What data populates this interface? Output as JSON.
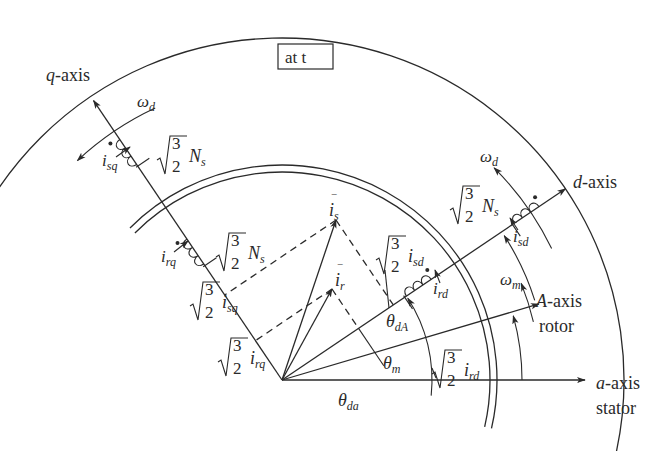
{
  "title_box": "at t",
  "axes": {
    "q_axis": {
      "name": "q",
      "suffix": "-axis"
    },
    "d_axis": {
      "name": "d",
      "suffix": "-axis"
    },
    "A_axis": {
      "name": "A",
      "suffix": "-axis",
      "sub": "rotor"
    },
    "a_axis": {
      "name": "a",
      "suffix": "-axis",
      "sub": "stator"
    }
  },
  "angles_deg": {
    "d_axis": 34,
    "q_axis": 124,
    "A_axis": 16.5,
    "a_axis": 0
  },
  "vectors": {
    "i_s": {
      "label": "i",
      "sub": "s"
    },
    "i_r": {
      "label": "i",
      "sub": "r"
    }
  },
  "labels": {
    "omega_d": {
      "main": "ω",
      "sub": "d"
    },
    "omega_m": {
      "main": "ω",
      "sub": "m"
    },
    "theta_da": {
      "main": "θ",
      "sub": "da"
    },
    "theta_m": {
      "main": "θ",
      "sub": "m"
    },
    "theta_dA": {
      "main": "θ",
      "sub": "dA"
    },
    "i_sq": {
      "main": "i",
      "sub": "sq"
    },
    "i_rq": {
      "main": "i",
      "sub": "rq"
    },
    "i_sd": {
      "main": "i",
      "sub": "sd"
    },
    "i_rd": {
      "main": "i",
      "sub": "rd"
    },
    "coeff_num": "3",
    "coeff_den": "2",
    "Ns_main": "N",
    "Ns_sub": "s"
  },
  "projection_labels": [
    {
      "id": "proj-isq",
      "var": "i",
      "sub": "sq"
    },
    {
      "id": "proj-irq",
      "var": "i",
      "sub": "rq"
    },
    {
      "id": "proj-isd",
      "var": "i",
      "sub": "sd"
    },
    {
      "id": "proj-ird",
      "var": "i",
      "sub": "rd"
    }
  ],
  "winding_labels": [
    {
      "id": "winding-sq",
      "main": "N",
      "sub": "s"
    },
    {
      "id": "winding-rq",
      "main": "N",
      "sub": "s"
    },
    {
      "id": "winding-sd",
      "main": "N",
      "sub": "s"
    }
  ]
}
